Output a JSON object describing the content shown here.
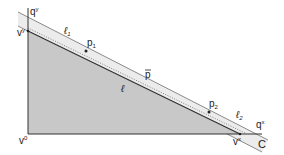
{
  "labels": {
    "qy": "q",
    "qy_sup": "y",
    "vy": "v",
    "vy_sup": "y",
    "v0": "v",
    "v0_sup": "0",
    "vx": "v",
    "vx_sup": "x",
    "qx": "q",
    "qx_sup": "x",
    "C": "C",
    "l1": "ℓ",
    "l1_sub": "1",
    "l2": "ℓ",
    "l2_sub": "2",
    "l": "ℓ",
    "p1": "p",
    "p1_sub": "1",
    "p2": "p",
    "p2_sub": "2",
    "pbar": "p"
  },
  "colors": {
    "triangle_fill": "#c8c8c8",
    "band_fill": "#ececec",
    "line": "#333333",
    "band_edge": "#888888"
  }
}
